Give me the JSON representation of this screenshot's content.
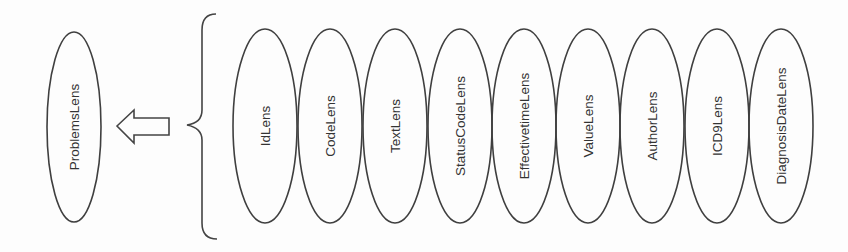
{
  "diagram": {
    "target": {
      "label": "ProblemsLens",
      "cx": 74,
      "cy": 127,
      "rx": 27,
      "ry": 95
    },
    "arrow": {
      "direction": "left",
      "points": "117,126 134,110 134,118 169,118 169,135 134,135 134,143"
    },
    "brace": {
      "direction": "left",
      "path": "M216,14 Q202,14 202,30 L202,110 Q202,123 187,125 Q202,128 202,140 L202,223 Q202,239 217,239"
    },
    "components": [
      {
        "label": "IdLens",
        "cx": 265
      },
      {
        "label": "CodeLens",
        "cx": 330
      },
      {
        "label": "TextLens",
        "cx": 395
      },
      {
        "label": "StatusCodeLens",
        "cx": 460
      },
      {
        "label": "EffectivetimeLens",
        "cx": 524
      },
      {
        "label": "ValueLens",
        "cx": 588
      },
      {
        "label": "AuthorLens",
        "cx": 652
      },
      {
        "label": "ICD9Lens",
        "cx": 717
      },
      {
        "label": "DiagnosisDateLens",
        "cx": 781
      }
    ],
    "component_ellipse": {
      "cy": 126,
      "rx": 32,
      "ry": 97
    },
    "colors": {
      "stroke": "#3f3f3f",
      "text": "#333333",
      "background": "#fdfdfd"
    }
  }
}
